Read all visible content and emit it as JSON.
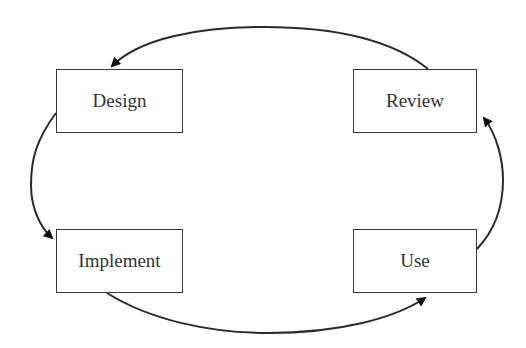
{
  "diagram": {
    "type": "cycle",
    "nodes": [
      {
        "id": "design",
        "label": "Design",
        "x": 56,
        "y": 69,
        "w": 127,
        "h": 64
      },
      {
        "id": "review",
        "label": "Review",
        "x": 353,
        "y": 69,
        "w": 124,
        "h": 64
      },
      {
        "id": "implement",
        "label": "Implement",
        "x": 56,
        "y": 229,
        "w": 127,
        "h": 64
      },
      {
        "id": "use",
        "label": "Use",
        "x": 353,
        "y": 229,
        "w": 124,
        "h": 64
      }
    ],
    "edges": [
      {
        "from": "review",
        "to": "design"
      },
      {
        "from": "design",
        "to": "implement"
      },
      {
        "from": "implement",
        "to": "use"
      },
      {
        "from": "use",
        "to": "review"
      }
    ],
    "colors": {
      "stroke": "#2a2a2a",
      "text": "#333333",
      "background": "#ffffff"
    }
  }
}
